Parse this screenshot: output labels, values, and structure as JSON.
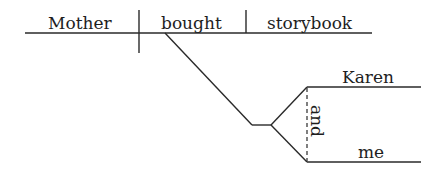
{
  "diagram": {
    "type": "sentence-diagram",
    "subject": "Mother",
    "verb": "bought",
    "direct_object": "storybook",
    "indirect_objects": [
      "Karen",
      "me"
    ],
    "conjunction": "and"
  }
}
